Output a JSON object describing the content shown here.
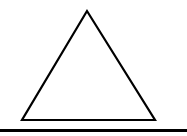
{
  "diagram": {
    "background": "#ffffff",
    "stroke_color": "#000000",
    "triangle": {
      "shape": "equilateral-triangle",
      "apex": [
        87,
        11
      ],
      "bottom_left": [
        22,
        120
      ],
      "bottom_right": [
        155,
        120
      ],
      "stroke_width": 2.2,
      "fill": "#ffffff"
    },
    "baseline": {
      "shape": "horizontal-line",
      "x1": 0,
      "x2": 187,
      "y": 130.5,
      "stroke_width": 3
    }
  }
}
